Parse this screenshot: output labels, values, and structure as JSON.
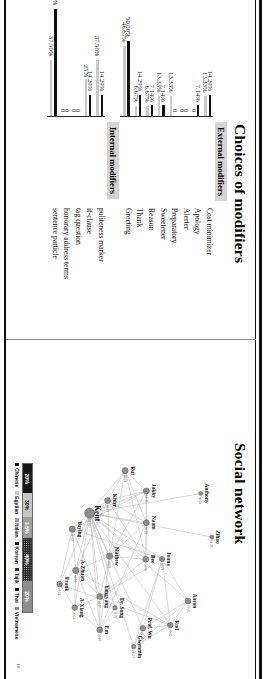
{
  "slide": {
    "page_number": "18",
    "panels": [
      {
        "id": "modifiers",
        "title": "Choices of modifiers"
      },
      {
        "id": "network",
        "title": "Social network"
      }
    ]
  },
  "modifiers": {
    "sections": [
      {
        "heading": "External modifiers",
        "categories": [
          "Cost minimizer",
          "Apology",
          "Alerter",
          "Preparatory",
          "Sweetener",
          "Reason",
          "Thank",
          "Greeting"
        ],
        "series": [
          {
            "name": "series-a",
            "color": "#101010",
            "values": [
              14.29,
              7.14,
              0,
              0,
              7.14,
              7.14,
              14.29,
              50.0
            ],
            "labels": [
              "14.29%",
              "7.14%",
              "0",
              "0",
              "7.14%",
              "7.14%",
              "14.29%",
              "50.00%"
            ]
          },
          {
            "name": "series-b",
            "color": "#c9c9c9",
            "values": [
              13.33,
              0,
              0,
              13.33,
              13.33,
              6.67,
              6.67,
              46.67
            ],
            "labels": [
              "13.33%",
              "0",
              "0",
              "13.33%",
              "13.33%",
              "6.67%",
              "6.67%",
              "46.67%"
            ]
          }
        ]
      },
      {
        "heading": "Internal modifiers",
        "categories": [
          "politeness marker",
          "if-clause",
          "tag question",
          "honorary address terms",
          "sentence particle"
        ],
        "series": [
          {
            "name": "series-a",
            "color": "#101010",
            "values": [
              14.29,
              14.29,
              0,
              0,
              71.43
            ],
            "labels": [
              "14.29%",
              "14.29%",
              "0",
              "0",
              "71.43%"
            ]
          },
          {
            "name": "series-b",
            "color": "#c9c9c9",
            "values": [
              37.5,
              25.0,
              0,
              0,
              37.5
            ],
            "labels": [
              "37.50%",
              "25%",
              "0",
              "0",
              "37.50%"
            ]
          }
        ]
      }
    ]
  },
  "network": {
    "hub": "Kent",
    "nodes": [
      {
        "label": "Zihao",
        "id": "id-25",
        "x": 0.585,
        "y": 0.118,
        "r": 2.1
      },
      {
        "label": "Anthony",
        "id": "id-24",
        "x": 0.448,
        "y": 0.175,
        "r": 2.1
      },
      {
        "label": "Joana",
        "id": "id-19",
        "x": 0.654,
        "y": 0.372,
        "r": 2.6
      },
      {
        "label": "Aaron",
        "id": "id-21",
        "x": 0.786,
        "y": 0.24,
        "r": 3.0
      },
      {
        "label": "Rod",
        "id": "id-22",
        "x": 0.862,
        "y": 0.33,
        "r": 2.8
      },
      {
        "label": "Prof. Wu",
        "id": "id-20",
        "x": 0.872,
        "y": 0.47,
        "r": 2.8
      },
      {
        "label": "Gwenmin",
        "id": "id-23",
        "x": 0.93,
        "y": 0.517,
        "r": 2.3
      },
      {
        "label": "Rui",
        "id": "id-12",
        "x": 0.376,
        "y": 0.56,
        "r": 3.1
      },
      {
        "label": "Jakky",
        "id": "id-11",
        "x": 0.44,
        "y": 0.452,
        "r": 3.0
      },
      {
        "label": "Naom",
        "id": "id-10",
        "x": 0.54,
        "y": 0.452,
        "r": 3.0
      },
      {
        "label": "Bee",
        "id": "id-09",
        "x": 0.655,
        "y": 0.455,
        "r": 3.0
      },
      {
        "label": "Khizr",
        "id": "id-13",
        "x": 0.47,
        "y": 0.65,
        "r": 3.0
      },
      {
        "label": "Mathew",
        "id": "id-08",
        "x": 0.645,
        "y": 0.64,
        "r": 3.2
      },
      {
        "label": "Kent",
        "id": "id-01",
        "x": 0.51,
        "y": 0.742,
        "r": 5.0
      },
      {
        "label": "Yuying",
        "id": "id-02",
        "x": 0.56,
        "y": 0.83,
        "r": 3.2
      },
      {
        "label": "Yangyang",
        "id": "id-07",
        "x": 0.772,
        "y": 0.69,
        "r": 3.0
      },
      {
        "label": "Dr. Song",
        "id": "id-06",
        "x": 0.808,
        "y": 0.612,
        "r": 2.3
      },
      {
        "label": "Em",
        "id": "id-05",
        "x": 0.877,
        "y": 0.69,
        "r": 3.0
      },
      {
        "label": "A-Xiang",
        "id": "id-04",
        "x": 0.807,
        "y": 0.818,
        "r": 2.8
      },
      {
        "label": "A-Zhuan",
        "id": "id-03",
        "x": 0.69,
        "y": 0.812,
        "r": 3.2
      },
      {
        "label": "Frank",
        "id": "id-14",
        "x": 0.733,
        "y": 0.895,
        "r": 2.8
      }
    ],
    "edges": [
      [
        0,
        13
      ],
      [
        1,
        13
      ],
      [
        2,
        13
      ],
      [
        2,
        3
      ],
      [
        2,
        4
      ],
      [
        2,
        5
      ],
      [
        3,
        4
      ],
      [
        3,
        5
      ],
      [
        3,
        6
      ],
      [
        4,
        5
      ],
      [
        4,
        6
      ],
      [
        5,
        6
      ],
      [
        2,
        6
      ],
      [
        3,
        13
      ],
      [
        4,
        13
      ],
      [
        5,
        13
      ],
      [
        6,
        13
      ],
      [
        7,
        8
      ],
      [
        7,
        9
      ],
      [
        7,
        10
      ],
      [
        7,
        11
      ],
      [
        7,
        12
      ],
      [
        8,
        9
      ],
      [
        8,
        10
      ],
      [
        8,
        11
      ],
      [
        8,
        12
      ],
      [
        9,
        10
      ],
      [
        9,
        11
      ],
      [
        9,
        12
      ],
      [
        10,
        11
      ],
      [
        10,
        12
      ],
      [
        11,
        12
      ],
      [
        7,
        13
      ],
      [
        8,
        13
      ],
      [
        9,
        13
      ],
      [
        10,
        13
      ],
      [
        11,
        13
      ],
      [
        12,
        13
      ],
      [
        13,
        14
      ],
      [
        13,
        15
      ],
      [
        13,
        16
      ],
      [
        13,
        17
      ],
      [
        13,
        18
      ],
      [
        13,
        19
      ],
      [
        13,
        20
      ],
      [
        14,
        15
      ],
      [
        14,
        19
      ],
      [
        14,
        20
      ],
      [
        15,
        16
      ],
      [
        15,
        17
      ],
      [
        15,
        18
      ],
      [
        15,
        19
      ],
      [
        16,
        17
      ],
      [
        17,
        18
      ],
      [
        17,
        19
      ],
      [
        18,
        19
      ],
      [
        19,
        20
      ],
      [
        12,
        15
      ],
      [
        12,
        17
      ],
      [
        12,
        19
      ],
      [
        10,
        15
      ],
      [
        9,
        17
      ],
      [
        11,
        19
      ],
      [
        8,
        14
      ],
      [
        14,
        2
      ],
      [
        15,
        2
      ],
      [
        19,
        4
      ],
      [
        20,
        4
      ],
      [
        18,
        20
      ]
    ],
    "legend": {
      "segments": [
        {
          "label": "20%",
          "style": "dark",
          "pct": 20
        },
        {
          "label": "30%",
          "style": "lt",
          "pct": 14
        },
        {
          "label": "3.5%",
          "style": "mid",
          "pct": 10
        },
        {
          "label": "40%",
          "style": "dot",
          "pct": 34
        },
        {
          "label": "20%",
          "style": "grey",
          "pct": 22
        }
      ],
      "keys": [
        {
          "label": "Chinese",
          "style": "dark"
        },
        {
          "label": "Egytian",
          "style": "lt"
        },
        {
          "label": "Italian",
          "style": "mid"
        },
        {
          "label": "Korean",
          "style": "dark"
        },
        {
          "label": "Tajik",
          "style": "dot"
        },
        {
          "label": "Thai",
          "style": "dark"
        },
        {
          "label": "Vietnamese",
          "style": "grey"
        }
      ]
    }
  }
}
